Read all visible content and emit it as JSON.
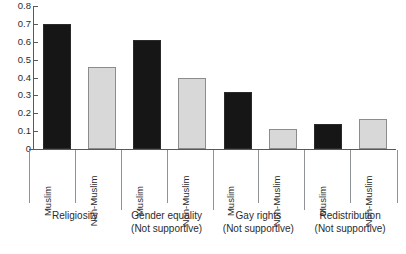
{
  "chart_data": {
    "type": "bar",
    "title": "",
    "xlabel": "",
    "ylabel": "",
    "ylim": [
      0,
      0.8
    ],
    "ytick_labels": [
      "0.8",
      "0.7",
      "0.6",
      "0.5",
      "0.4",
      "0.3",
      "0.2",
      "0.1",
      "0"
    ],
    "ytick_values": [
      0.8,
      0.7,
      0.6,
      0.5,
      0.4,
      0.3,
      0.2,
      0.1,
      0
    ],
    "grid": false,
    "legend": "none",
    "categories": [
      "Religiosity",
      "Gender equality (Not supportive)",
      "Gay rights (Not supportive)",
      "Redistribution (Not supportive)"
    ],
    "subcategories": [
      "Muslim",
      "Non-Muslim"
    ],
    "series": [
      {
        "name": "Muslim",
        "color": "#161616",
        "values": [
          0.7,
          0.61,
          0.32,
          0.14
        ]
      },
      {
        "name": "Non-Muslim",
        "color": "#d8d8d8",
        "values": [
          0.46,
          0.4,
          0.11,
          0.17
        ]
      }
    ],
    "bars": [
      {
        "group": "Religiosity",
        "sub": "Muslim",
        "value": 0.7,
        "style": "dark"
      },
      {
        "group": "Religiosity",
        "sub": "Non-Muslim",
        "value": 0.46,
        "style": "light"
      },
      {
        "group": "Gender equality (Not supportive)",
        "sub": "Muslim",
        "value": 0.61,
        "style": "dark"
      },
      {
        "group": "Gender equality (Not supportive)",
        "sub": "Non-Muslim",
        "value": 0.4,
        "style": "light"
      },
      {
        "group": "Gay rights (Not supportive)",
        "sub": "Muslim",
        "value": 0.32,
        "style": "dark"
      },
      {
        "group": "Gay rights (Not supportive)",
        "sub": "Non-Muslim",
        "value": 0.11,
        "style": "light"
      },
      {
        "group": "Redistribution (Not supportive)",
        "sub": "Muslim",
        "value": 0.14,
        "style": "dark"
      },
      {
        "group": "Redistribution (Not supportive)",
        "sub": "Non-Muslim",
        "value": 0.17,
        "style": "light"
      }
    ]
  },
  "axis": {
    "ticks": [
      {
        "label": "0.8"
      },
      {
        "label": "0.7"
      },
      {
        "label": "0.6"
      },
      {
        "label": "0.5"
      },
      {
        "label": "0.4"
      },
      {
        "label": "0.3"
      },
      {
        "label": "0.2"
      },
      {
        "label": "0.1"
      },
      {
        "label": "0"
      }
    ]
  },
  "tick_labels": [
    {
      "text": "Muslim"
    },
    {
      "text": "Non-Muslim"
    },
    {
      "text": "Muslim"
    },
    {
      "text": "Non-Muslim"
    },
    {
      "text": "Muslim"
    },
    {
      "text": "Non-Muslim"
    },
    {
      "text": "Muslim"
    },
    {
      "text": "Non-Muslim"
    }
  ],
  "groups": [
    {
      "line1": "Religiosity",
      "line2": ""
    },
    {
      "line1": "Gender equality",
      "line2": "(Not supportive)"
    },
    {
      "line1": "Gay rights",
      "line2": "(Not supportive)"
    },
    {
      "line1": "Redistribution",
      "line2": "(Not supportive)"
    }
  ],
  "colors": {
    "muslim_bar": "#161616",
    "nonmuslim_bar": "#d8d8d8",
    "axis": "#555a5e",
    "separator": "#8e9295",
    "text": "#2b2b2b",
    "background": "#ffffff"
  }
}
